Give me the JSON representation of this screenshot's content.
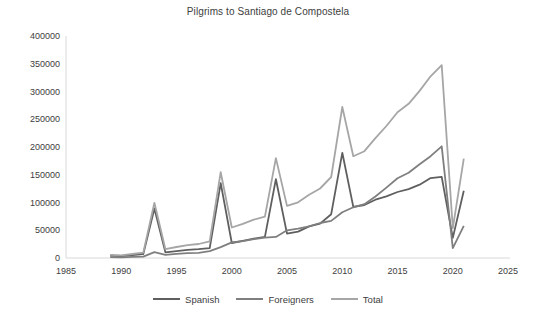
{
  "chart": {
    "title": "Pilgrims to Santiago de Compostela"
  },
  "chart_data": {
    "type": "line",
    "title": "Pilgrims to Santiago de Compostela",
    "xlabel": "",
    "ylabel": "",
    "x": [
      1989,
      1990,
      1991,
      1992,
      1993,
      1994,
      1995,
      1996,
      1997,
      1998,
      1999,
      2000,
      2001,
      2002,
      2003,
      2004,
      2005,
      2006,
      2007,
      2008,
      2009,
      2010,
      2011,
      2012,
      2013,
      2014,
      2015,
      2016,
      2017,
      2018,
      2019,
      2020,
      2021
    ],
    "series": [
      {
        "name": "Spanish",
        "color": "#5f5f5f",
        "values": [
          4200,
          3600,
          5200,
          7200,
          89000,
          10100,
          12400,
          14600,
          15900,
          17800,
          135000,
          26963,
          31000,
          35000,
          38000,
          142000,
          44000,
          47500,
          57000,
          62000,
          79000,
          189543,
          92000,
          95500,
          105000,
          111000,
          119000,
          124200,
          132000,
          144000,
          146350,
          36300,
          121000
        ]
      },
      {
        "name": "Foreigners",
        "color": "#7f7f7f",
        "values": [
          1560,
          1318,
          2074,
          2564,
          10436,
          5763,
          7421,
          8618,
          9279,
          12326,
          19613,
          28041,
          30418,
          33952,
          36614,
          37944,
          49924,
          52877,
          57026,
          63141,
          66877,
          82592,
          91366,
          96988,
          110880,
          126886,
          143516,
          153654,
          169036,
          183378,
          201228,
          17605,
          57912
        ]
      },
      {
        "name": "Total",
        "color": "#a6a6a6",
        "values": [
          5760,
          4918,
          7274,
          9764,
          99436,
          15863,
          19821,
          23218,
          25179,
          30126,
          154613,
          55004,
          61418,
          68952,
          74614,
          179944,
          93924,
          100377,
          114026,
          125141,
          145877,
          272135,
          183366,
          192488,
          215880,
          237886,
          262516,
          277854,
          301036,
          327378,
          347578,
          53905,
          178912
        ]
      }
    ],
    "xlim": [
      1985,
      2025
    ],
    "ylim": [
      0,
      400000
    ],
    "x_ticks": [
      1985,
      1990,
      1995,
      2000,
      2005,
      2010,
      2015,
      2020,
      2025
    ],
    "y_ticks": [
      0,
      50000,
      100000,
      150000,
      200000,
      250000,
      300000,
      350000,
      400000
    ],
    "grid": false,
    "legend_position": "bottom",
    "legend": [
      "Spanish",
      "Foreigners",
      "Total"
    ],
    "axis_color": "#d9d9d9",
    "text_color": "#404040"
  }
}
